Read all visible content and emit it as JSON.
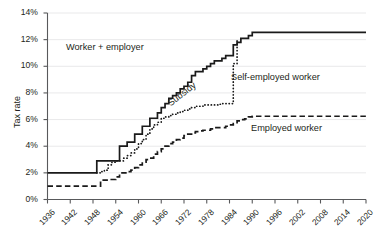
{
  "chart_data": {
    "type": "line",
    "title": "",
    "xlabel": "",
    "ylabel": "Tax rate",
    "xlim": [
      1936,
      2020
    ],
    "ylim": [
      0,
      14
    ],
    "grid": true,
    "legend_position": "inline-annotations",
    "ytick_labels": [
      "0%",
      "2%",
      "4%",
      "6%",
      "8%",
      "10%",
      "12%",
      "14%"
    ],
    "ytick_values": [
      0,
      2,
      4,
      6,
      8,
      10,
      12,
      14
    ],
    "xtick_labels": [
      "1936",
      "1942",
      "1948",
      "1954",
      "1960",
      "1966",
      "1972",
      "1978",
      "1984",
      "1990",
      "1996",
      "2002",
      "2008",
      "2014",
      "2020"
    ],
    "xtick_values": [
      1936,
      1942,
      1948,
      1954,
      1960,
      1966,
      1972,
      1978,
      1984,
      1990,
      1996,
      2002,
      2008,
      2014,
      2020
    ],
    "annotations": [
      {
        "text": "Worker + employer",
        "x": 1948,
        "y": 11.4,
        "rotation": 0
      },
      {
        "text": "Self-employed worker",
        "x": 1988,
        "y": 8.6,
        "rotation": 0
      },
      {
        "text": "Employed worker",
        "x": 1994,
        "y": 5.1,
        "rotation": 0
      },
      {
        "text": "Subsidy",
        "x": 1970,
        "y": 8.6,
        "rotation": -38
      }
    ],
    "series": [
      {
        "name": "Worker + employer",
        "style": "solid",
        "color": "#1a1a1a",
        "x": [
          1936,
          1938,
          1940,
          1942,
          1944,
          1946,
          1948,
          1949,
          1950,
          1951,
          1952,
          1953,
          1954,
          1955,
          1956,
          1957,
          1958,
          1959,
          1960,
          1961,
          1962,
          1963,
          1964,
          1965,
          1966,
          1967,
          1968,
          1969,
          1970,
          1971,
          1972,
          1973,
          1974,
          1975,
          1976,
          1977,
          1978,
          1979,
          1980,
          1981,
          1982,
          1983,
          1984,
          1985,
          1986,
          1987,
          1988,
          1989,
          1990,
          1992,
          1996,
          2000,
          2004,
          2008,
          2012,
          2016,
          2020
        ],
        "values": [
          2.0,
          2.0,
          2.0,
          2.0,
          2.0,
          2.0,
          2.0,
          2.9,
          2.9,
          2.9,
          2.9,
          2.9,
          2.9,
          4.0,
          4.0,
          4.3,
          4.3,
          4.9,
          4.9,
          5.5,
          5.5,
          6.1,
          6.1,
          6.5,
          6.9,
          7.2,
          7.6,
          7.8,
          8.0,
          8.3,
          8.5,
          8.8,
          9.3,
          9.6,
          9.6,
          9.8,
          10.0,
          10.2,
          10.4,
          10.4,
          10.6,
          10.8,
          10.8,
          11.6,
          11.8,
          12.1,
          12.1,
          12.3,
          12.55,
          12.55,
          12.55,
          12.55,
          12.55,
          12.55,
          12.55,
          12.55,
          12.55
        ]
      },
      {
        "name": "Self-employed worker",
        "style": "dotted",
        "color": "#1a1a1a",
        "x": [
          1949,
          1950,
          1951,
          1952,
          1953,
          1954,
          1955,
          1956,
          1957,
          1958,
          1959,
          1960,
          1961,
          1962,
          1963,
          1964,
          1965,
          1966,
          1967,
          1968,
          1969,
          1970,
          1971,
          1972,
          1973,
          1974,
          1975,
          1976,
          1977,
          1978,
          1979,
          1980,
          1981,
          1982,
          1983,
          1984,
          1985,
          1986
        ],
        "values": [
          2.0,
          2.1,
          2.2,
          2.6,
          2.8,
          2.9,
          2.9,
          3.1,
          3.3,
          3.5,
          3.8,
          4.2,
          4.5,
          4.9,
          5.3,
          5.6,
          5.8,
          6.1,
          6.2,
          6.3,
          6.4,
          6.5,
          6.6,
          6.7,
          6.8,
          6.9,
          7.0,
          7.0,
          7.1,
          7.1,
          7.1,
          7.1,
          7.15,
          7.2,
          7.2,
          7.2,
          10.2,
          11.9
        ]
      },
      {
        "name": "Employed worker",
        "style": "dashed",
        "color": "#1a1a1a",
        "x": [
          1936,
          1938,
          1940,
          1942,
          1944,
          1946,
          1948,
          1949,
          1950,
          1951,
          1952,
          1953,
          1954,
          1955,
          1956,
          1957,
          1958,
          1959,
          1960,
          1961,
          1962,
          1963,
          1964,
          1965,
          1966,
          1967,
          1968,
          1969,
          1970,
          1971,
          1972,
          1973,
          1974,
          1975,
          1976,
          1977,
          1978,
          1979,
          1980,
          1981,
          1982,
          1983,
          1984,
          1985,
          1986,
          1987,
          1988,
          1989,
          1990,
          1994,
          2000,
          2006,
          2012,
          2016,
          2020
        ],
        "values": [
          1.0,
          1.0,
          1.0,
          1.0,
          1.0,
          1.0,
          1.0,
          1.0,
          1.45,
          1.45,
          1.5,
          1.5,
          1.7,
          2.0,
          2.0,
          2.1,
          2.2,
          2.4,
          2.6,
          2.8,
          3.0,
          3.1,
          3.4,
          3.6,
          3.8,
          4.0,
          4.2,
          4.3,
          4.5,
          4.6,
          4.8,
          4.9,
          5.0,
          5.1,
          5.15,
          5.2,
          5.2,
          5.3,
          5.4,
          5.4,
          5.4,
          5.5,
          5.6,
          5.7,
          5.9,
          6.0,
          6.05,
          6.2,
          6.25,
          6.25,
          6.25,
          6.25,
          6.25,
          6.25,
          6.25
        ]
      }
    ]
  },
  "axis": {
    "y_title": "Tax rate"
  }
}
